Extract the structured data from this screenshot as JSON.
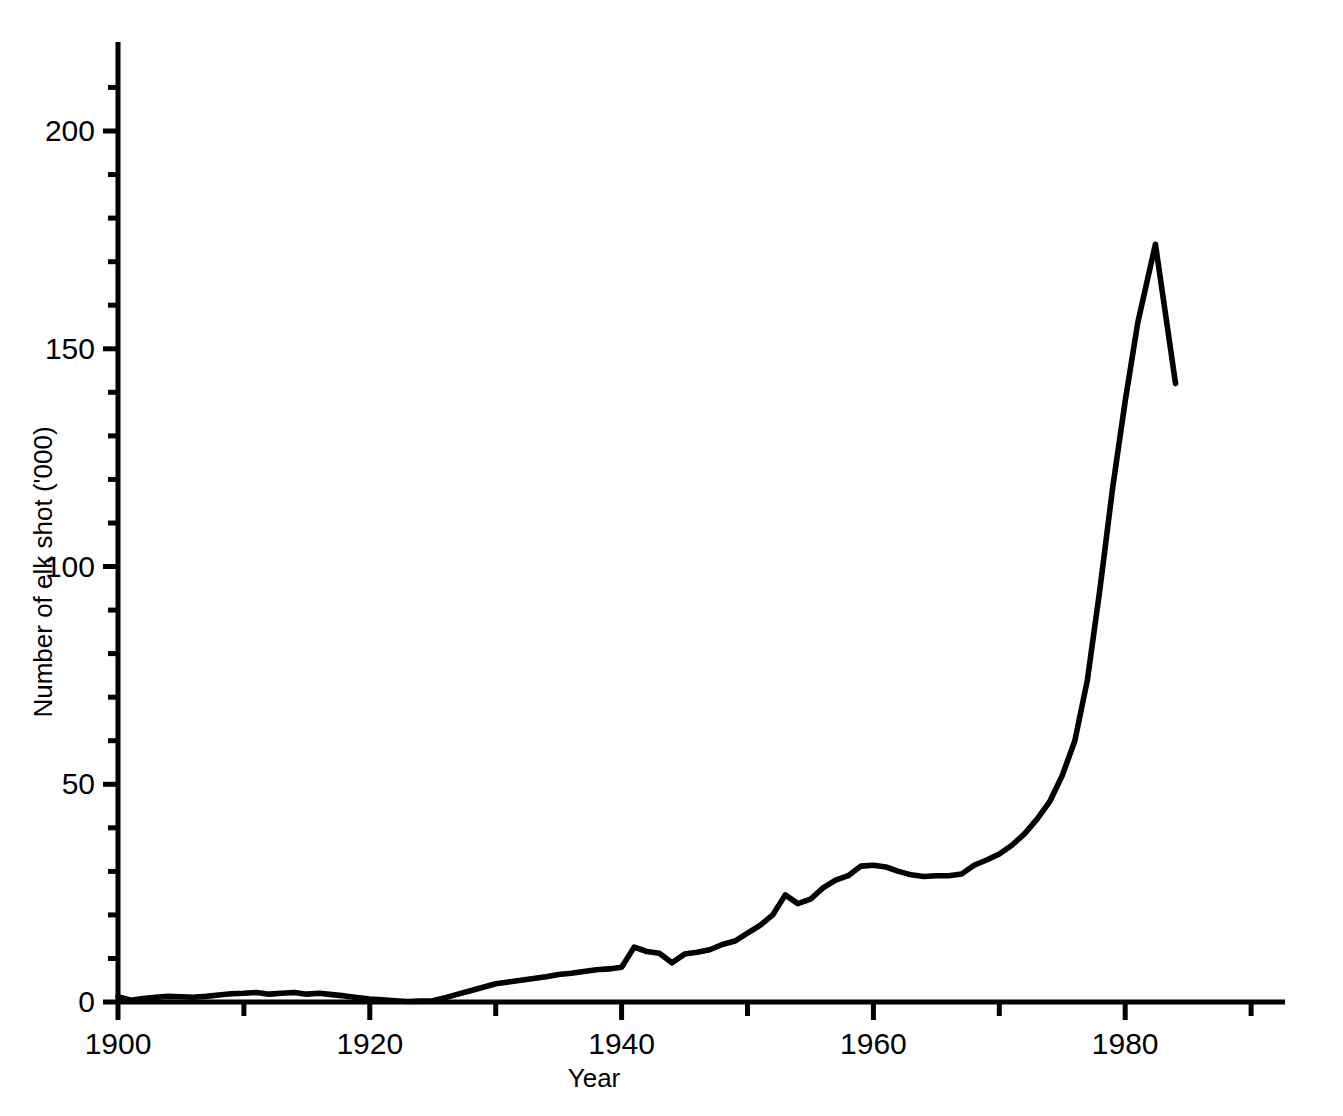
{
  "chart_data": {
    "type": "line",
    "title": "",
    "xlabel": "Year",
    "ylabel": "Number of elk shot ('000)",
    "xlim": [
      1900,
      1992.7
    ],
    "ylim": [
      0,
      220
    ],
    "grid": false,
    "legend": "none",
    "x_major_ticks": [
      1900,
      1920,
      1940,
      1960,
      1980
    ],
    "x_major_tick_labels": [
      "1900",
      "1920",
      "1940",
      "1960",
      "1980"
    ],
    "x_minor_ticks": [
      1910,
      1930,
      1950,
      1970,
      1990
    ],
    "y_major_ticks": [
      0,
      50,
      100,
      150,
      200
    ],
    "y_major_tick_labels": [
      "0",
      "50",
      "100",
      "150",
      "200"
    ],
    "y_minor_ticks": [
      10,
      20,
      30,
      40,
      60,
      70,
      80,
      90,
      110,
      120,
      130,
      140,
      160,
      170,
      180,
      190,
      210
    ],
    "line_color": "#000000",
    "background_color": "#ffffff",
    "series": [
      {
        "name": "Number of elk shot ('000)",
        "x": [
          1900,
          1901,
          1902,
          1903,
          1904,
          1905,
          1906,
          1907,
          1908,
          1909,
          1910,
          1911,
          1912,
          1913,
          1914,
          1915,
          1916,
          1917,
          1918,
          1919,
          1920,
          1921,
          1922,
          1923,
          1924,
          1925,
          1926,
          1927,
          1928,
          1929,
          1930,
          1931,
          1932,
          1933,
          1934,
          1935,
          1936,
          1937,
          1938,
          1939,
          1940,
          1941,
          1942,
          1943,
          1944,
          1945,
          1946,
          1947,
          1948,
          1949,
          1950,
          1951,
          1952,
          1953,
          1954,
          1955,
          1956,
          1957,
          1958,
          1959,
          1960,
          1961,
          1962,
          1963,
          1964,
          1965,
          1966,
          1967,
          1968,
          1969,
          1970,
          1971,
          1972,
          1973,
          1974,
          1975,
          1976,
          1977,
          1978,
          1979,
          1980,
          1981,
          1982.4,
          1984
        ],
        "y": [
          1.2,
          0.4,
          0.8,
          1.1,
          1.3,
          1.2,
          1.1,
          1.3,
          1.6,
          1.9,
          2.0,
          2.2,
          1.8,
          2.0,
          2.2,
          1.8,
          2.0,
          1.7,
          1.4,
          1.0,
          0.7,
          0.5,
          0.3,
          0.1,
          0.2,
          0.3,
          1.0,
          1.8,
          2.6,
          3.4,
          4.2,
          4.6,
          5.0,
          5.4,
          5.8,
          6.3,
          6.6,
          7.0,
          7.4,
          7.6,
          8.0,
          12.6,
          11.6,
          11.2,
          9.0,
          11.0,
          11.4,
          12.0,
          13.2,
          14.0,
          15.8,
          17.6,
          20.0,
          24.6,
          22.6,
          23.6,
          26.2,
          28.0,
          29.0,
          31.2,
          31.4,
          31.0,
          30.0,
          29.2,
          28.8,
          29.0,
          29.0,
          29.4,
          31.4,
          32.6,
          34.0,
          36.0,
          38.6,
          42.0,
          46.0,
          52.0,
          60.0,
          74.0,
          95.0,
          118.0,
          138.0,
          156.0,
          174.0,
          142.0
        ]
      }
    ]
  },
  "axis_geometry": {
    "plot_left_px": 118,
    "plot_zero_y_px": 1002,
    "px_per_year": 12.59,
    "px_per_unit": 4.355,
    "y_axis_top_px": 42,
    "x_axis_right_px": 1285
  }
}
